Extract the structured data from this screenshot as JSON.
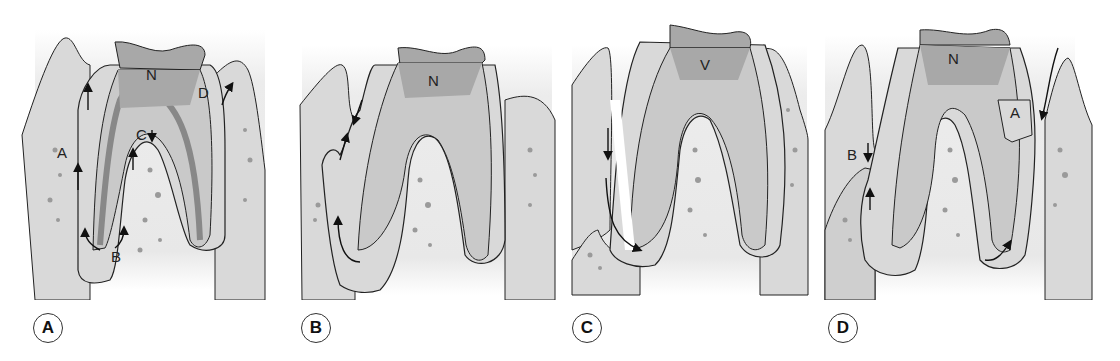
{
  "figure": {
    "colors": {
      "gingiva": "#d9d9d9",
      "bone_bg": "#e6e6e6",
      "dentin": "#c9c9c9",
      "pulp": "#a8a8a8",
      "outline": "#222222",
      "bone_spots": "#9a9a9a"
    },
    "panels": [
      {
        "id": "A",
        "badge": "A",
        "labels": {
          "N": "N",
          "D": "D",
          "C": "C",
          "A": "A",
          "B": "B"
        }
      },
      {
        "id": "B",
        "badge": "B",
        "labels": {
          "N": "N"
        }
      },
      {
        "id": "C",
        "badge": "C",
        "labels": {
          "V": "V"
        }
      },
      {
        "id": "D",
        "badge": "D",
        "labels": {
          "N": "N",
          "A": "A",
          "B": "B"
        }
      }
    ]
  }
}
